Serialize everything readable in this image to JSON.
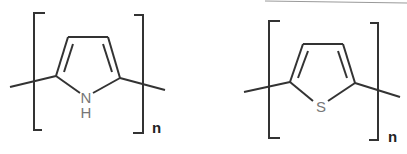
{
  "structures": [
    {
      "name": "polypyrrole",
      "heteroatom": "N",
      "heteroatom_h": "H",
      "repeat_subscript": "n"
    },
    {
      "name": "polythiophene",
      "heteroatom": "S",
      "repeat_subscript": "n"
    }
  ],
  "colors": {
    "bond": "#333333",
    "atom_label": "#777777",
    "background": "#ffffff"
  }
}
